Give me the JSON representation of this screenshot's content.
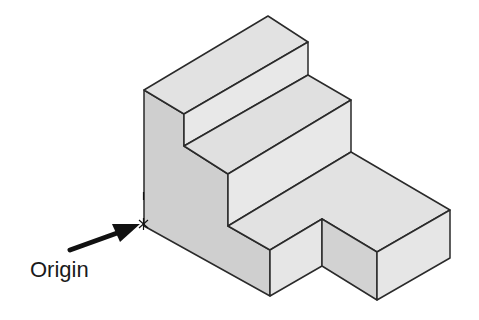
{
  "figure": {
    "annotation_label": "Origin",
    "colors": {
      "edge": "#2a2a2a",
      "left_face": "#cfcfcf",
      "top_face": "#e2e2e2",
      "front_face": "#dadada",
      "right_face": "#e6e6e6",
      "arrow": "#111111",
      "background": "#ffffff"
    }
  }
}
